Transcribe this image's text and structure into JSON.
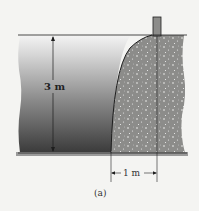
{
  "figure": {
    "caption": "(a)",
    "labels": {
      "water_depth": "3 m",
      "dam_width": "1 m"
    },
    "colors": {
      "background": "#f4f4f2",
      "water_top": "#ececec",
      "water_bottom": "#3a3a3a",
      "concrete": "#8a8a88",
      "line": "#1e1e1e"
    }
  }
}
